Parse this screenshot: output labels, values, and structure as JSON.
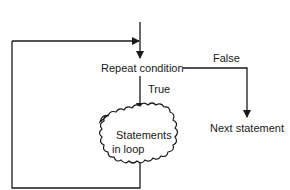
{
  "diagram": {
    "type": "flowchart",
    "nodes": {
      "condition": {
        "label": "Repeat condition"
      },
      "loop_body": {
        "label_line1": "Statements",
        "label_line2": "in loop",
        "shape": "cloud"
      },
      "next": {
        "label": "Next statement"
      }
    },
    "edges": {
      "true_label": "True",
      "false_label": "False"
    },
    "colors": {
      "line": "#1a1a1a",
      "background": "#ffffff"
    }
  }
}
